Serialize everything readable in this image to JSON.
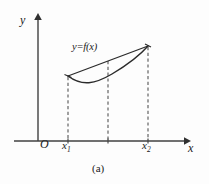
{
  "figure": {
    "caption": "(a)",
    "background_color": "#fdfdfd",
    "stroke_color": "#2b2b2b",
    "axis_color": "#404040",
    "dash_color": "#555555"
  },
  "axes": {
    "y_label": "y",
    "x_label": "x",
    "origin_label": "O",
    "y_axis": {
      "x": 38,
      "y_top": 14,
      "y_bottom": 141
    },
    "x_axis": {
      "y": 141,
      "x_left": 14,
      "x_right": 186
    }
  },
  "curve": {
    "function_label": "y=f(x)",
    "type": "convex-curve-with-chord",
    "left_point": {
      "x": 68,
      "y": 76
    },
    "right_point": {
      "x": 148,
      "y": 46
    },
    "minimum_point": {
      "x": 104,
      "y": 82
    },
    "description": "Convex function arc lying below the straight chord joining the two endpoints"
  },
  "chord": {
    "from": {
      "x": 68,
      "y": 76
    },
    "to": {
      "x": 148,
      "y": 46
    }
  },
  "ticks": [
    {
      "name": "x1",
      "label": "x",
      "subscript": "1",
      "x": 68
    },
    {
      "name": "midpoint",
      "label": "",
      "subscript": "",
      "x": 108
    },
    {
      "name": "x2",
      "label": "x",
      "subscript": "2",
      "x": 148
    }
  ],
  "dashed_lines": [
    {
      "name": "x1-guide",
      "x": 68,
      "y_top": 76,
      "y_bottom": 141
    },
    {
      "name": "midpoint-guide",
      "x": 108,
      "y_top": 61,
      "y_bottom": 141
    },
    {
      "name": "x2-guide",
      "x": 148,
      "y_top": 46,
      "y_bottom": 141
    }
  ]
}
